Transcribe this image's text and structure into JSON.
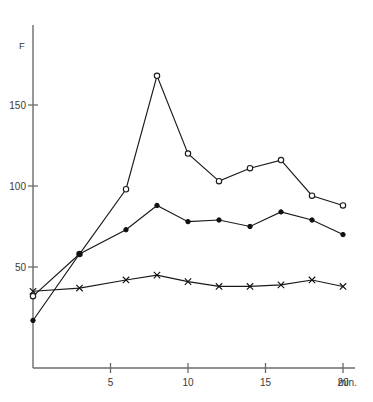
{
  "chart_data": {
    "type": "line",
    "title": "",
    "xlabel": "min.",
    "ylabel": "F",
    "xlim": [
      0,
      21
    ],
    "ylim": [
      0,
      185
    ],
    "grid": false,
    "legend": "none",
    "x_ticks": [
      5,
      10,
      15,
      20
    ],
    "x_tick_labels": [
      "5",
      "10",
      "15",
      "20"
    ],
    "y_ticks": [
      50,
      100,
      150
    ],
    "y_tick_labels": [
      "50",
      "100",
      "150"
    ],
    "x_axis_suffix": "min.",
    "series": [
      {
        "name": "open-circle-series",
        "marker": "open-circle",
        "x": [
          0,
          3,
          6,
          8,
          10,
          12,
          14,
          16,
          18,
          20
        ],
        "values": [
          32,
          58,
          98,
          168,
          120,
          103,
          111,
          116,
          94,
          88
        ]
      },
      {
        "name": "filled-circle-series",
        "marker": "filled-circle",
        "x": [
          0,
          3,
          6,
          8,
          10,
          12,
          14,
          16,
          18,
          20
        ],
        "values": [
          17,
          58,
          73,
          88,
          78,
          79,
          75,
          84,
          79,
          70
        ]
      },
      {
        "name": "cross-series",
        "marker": "cross",
        "x": [
          0,
          3,
          6,
          8,
          10,
          12,
          14,
          16,
          18,
          20
        ],
        "values": [
          35,
          37,
          42,
          45,
          41,
          38,
          38,
          39,
          42,
          38
        ]
      }
    ]
  },
  "axis": {
    "y_label": "F",
    "x_unit": "min."
  }
}
